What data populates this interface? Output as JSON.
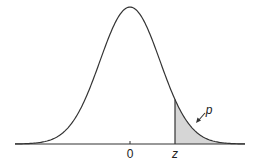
{
  "figure": {
    "type": "standard normal density with shaded upper tail",
    "labels": {
      "mean": "0",
      "z": "z",
      "tail_area": "p"
    },
    "colors": {
      "curve": "#333333",
      "shade": "#d6d6d6",
      "axis": "#333333"
    }
  }
}
